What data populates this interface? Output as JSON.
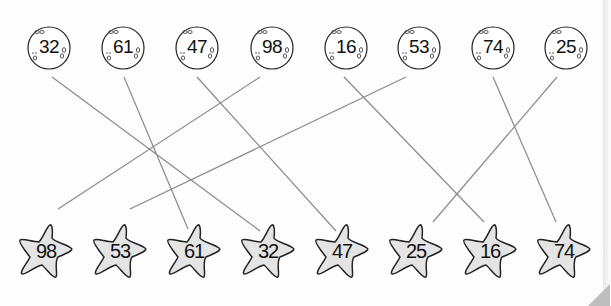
{
  "worksheet": {
    "title_fragment": "p",
    "moons": [
      {
        "label": "32",
        "x": 26
      },
      {
        "label": "61",
        "x": 100
      },
      {
        "label": "47",
        "x": 174
      },
      {
        "label": "98",
        "x": 249
      },
      {
        "label": "16",
        "x": 323
      },
      {
        "label": "53",
        "x": 396
      },
      {
        "label": "74",
        "x": 470
      },
      {
        "label": "25",
        "x": 543
      }
    ],
    "stars": [
      {
        "label": "98",
        "x": 16
      },
      {
        "label": "53",
        "x": 90
      },
      {
        "label": "61",
        "x": 164
      },
      {
        "label": "32",
        "x": 238
      },
      {
        "label": "47",
        "x": 312
      },
      {
        "label": "25",
        "x": 386
      },
      {
        "label": "16",
        "x": 460
      },
      {
        "label": "74",
        "x": 534
      }
    ],
    "connections": [
      {
        "from": "32",
        "to": "32"
      },
      {
        "from": "61",
        "to": "61"
      },
      {
        "from": "47",
        "to": "47"
      },
      {
        "from": "98",
        "to": "98"
      },
      {
        "from": "16",
        "to": "16"
      },
      {
        "from": "53",
        "to": "53"
      },
      {
        "from": "74",
        "to": "74"
      },
      {
        "from": "25",
        "to": "25"
      }
    ],
    "colors": {
      "line": "#8a8a8a",
      "star_fill": "#e4e4e4",
      "outline": "#222222"
    }
  }
}
